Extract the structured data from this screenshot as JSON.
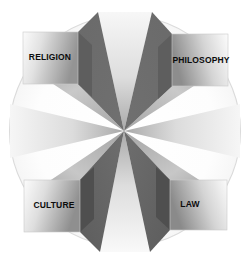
{
  "diagram": {
    "type": "radial-block-diagram",
    "background_color": "#ffffff",
    "circle": {
      "name": "outer-circle",
      "center_x": 125,
      "center_y": 131,
      "radius": 116,
      "stroke_color": "#dcdcdc",
      "fill_color": "#fdfdfd"
    },
    "center_star": {
      "name": "central-pinwheel",
      "center_x": 124,
      "center_y": 131,
      "wedge_count": 8,
      "dark_color": "#6b6b6b",
      "light_color": "#f2f2f2",
      "mid_color": "#b8b8b8"
    },
    "nodes": [
      {
        "id": "religion",
        "label": "RELIGION",
        "position": "top-left",
        "face_gradient_from": "#fafafa",
        "face_gradient_to": "#9a9a9a",
        "side_color": "#5e5e5e",
        "text_color": "#0b0b0b"
      },
      {
        "id": "philosophy",
        "label": "PHILOSOPHY",
        "position": "top-right",
        "face_gradient_from": "#8f8f8f",
        "face_gradient_to": "#fbfbfb",
        "side_color": "#5e5e5e",
        "text_color": "#0b0b0b"
      },
      {
        "id": "culture",
        "label": "CULTURE",
        "position": "bottom-left",
        "face_gradient_from": "#fafafa",
        "face_gradient_to": "#9a9a9a",
        "side_color": "#4f4f4f",
        "text_color": "#0b0b0b"
      },
      {
        "id": "law",
        "label": "LAW",
        "position": "bottom-right",
        "face_gradient_from": "#8f8f8f",
        "face_gradient_to": "#fbfbfb",
        "side_color": "#4f4f4f",
        "text_color": "#0b0b0b"
      }
    ]
  }
}
